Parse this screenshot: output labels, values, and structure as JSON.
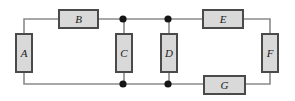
{
  "diagram": {
    "type": "circuit-network",
    "title": "",
    "canvas": {
      "width": 295,
      "height": 101
    },
    "colors": {
      "background": "#ffffff",
      "wire": "#8a8a8a",
      "box_fill": "#d9d9d9",
      "box_border": "#4a4a4a",
      "junction_dot": "#151515",
      "label_text": "#1a1a1a"
    },
    "components": [
      {
        "id": "a",
        "label": "A",
        "orientation": "vertical",
        "x": 15,
        "y": 33,
        "width": 18,
        "height": 40
      },
      {
        "id": "b",
        "label": "B",
        "orientation": "horizontal",
        "x": 58,
        "y": 9,
        "width": 41,
        "height": 20
      },
      {
        "id": "c",
        "label": "C",
        "orientation": "vertical",
        "x": 115,
        "y": 33,
        "width": 18,
        "height": 40
      },
      {
        "id": "d",
        "label": "D",
        "orientation": "vertical",
        "x": 160,
        "y": 33,
        "width": 18,
        "height": 40
      },
      {
        "id": "e",
        "label": "E",
        "orientation": "horizontal",
        "x": 202,
        "y": 9,
        "width": 42,
        "height": 20
      },
      {
        "id": "f",
        "label": "F",
        "orientation": "vertical",
        "x": 261,
        "y": 33,
        "width": 18,
        "height": 40
      },
      {
        "id": "g",
        "label": "G",
        "orientation": "horizontal",
        "x": 203,
        "y": 75,
        "width": 43,
        "height": 20
      }
    ],
    "junctions": [
      {
        "id": "j-top-left",
        "x": 123,
        "y": 19,
        "radius": 3.6
      },
      {
        "id": "j-top-right",
        "x": 168,
        "y": 19,
        "radius": 3.6
      },
      {
        "id": "j-bottom-left",
        "x": 123,
        "y": 84,
        "radius": 3.6
      },
      {
        "id": "j-bottom-right",
        "x": 168,
        "y": 84,
        "radius": 3.6
      }
    ],
    "wires": [
      {
        "id": "wire-a-top-to-b",
        "d": "M 24 54 L 24 19 L 58 19"
      },
      {
        "id": "wire-b-to-junction1",
        "d": "M 99 19 L 168 19"
      },
      {
        "id": "wire-junction2-to-e",
        "d": "M 168 19 L 202 19"
      },
      {
        "id": "wire-e-to-f-top",
        "d": "M 244 19 L 270 19 L 270 54"
      },
      {
        "id": "wire-a-bottom-to-rail",
        "d": "M 24 54 L 24 84 L 123 84"
      },
      {
        "id": "wire-bottom-rail-mid",
        "d": "M 123 84 L 203 84"
      },
      {
        "id": "wire-g-to-f-bottom",
        "d": "M 246 84 L 270 84 L 270 54"
      },
      {
        "id": "wire-c-stub-top",
        "d": "M 124 19 L 124 33"
      },
      {
        "id": "wire-c-stub-bottom",
        "d": "M 124 73 L 124 84"
      },
      {
        "id": "wire-d-stub-top",
        "d": "M 169 19 L 169 33"
      },
      {
        "id": "wire-d-stub-bottom",
        "d": "M 169 73 L 169 84"
      }
    ]
  }
}
